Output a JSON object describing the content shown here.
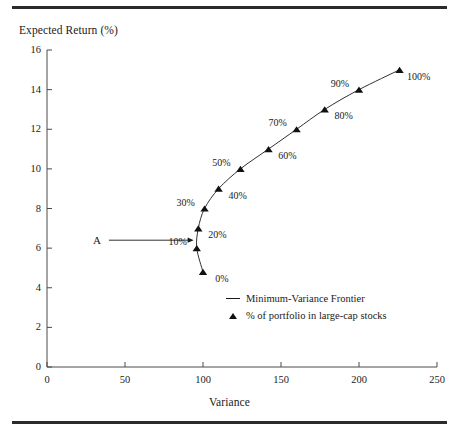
{
  "figure": {
    "top_rule": "horizontal-rule",
    "bottom_rule": "horizontal-rule"
  },
  "chart_data": {
    "type": "scatter",
    "title": "",
    "xlabel": "Variance",
    "ylabel": "Expected Return (%)",
    "xlim": [
      0,
      250
    ],
    "ylim": [
      0,
      16
    ],
    "xticks": [
      0,
      50,
      100,
      150,
      200,
      250
    ],
    "yticks": [
      0,
      2,
      4,
      6,
      8,
      10,
      12,
      14,
      16
    ],
    "grid": false,
    "legend_position": "inside-lower-right",
    "series": [
      {
        "name": "Minimum-Variance Frontier",
        "marker": "triangle",
        "x": [
          100,
          96,
          97,
          101,
          110,
          124,
          142,
          160,
          178,
          200,
          226
        ],
        "y": [
          4.8,
          6.0,
          7.0,
          8.0,
          9.0,
          10.0,
          11.0,
          12.0,
          13.0,
          14.0,
          15.0
        ],
        "point_labels": [
          "0%",
          "10%",
          "20%",
          "30%",
          "40%",
          "50%",
          "60%",
          "70%",
          "80%",
          "90%",
          "100%"
        ],
        "label_placement": [
          "right",
          "left",
          "right",
          "left",
          "right",
          "left",
          "right",
          "left",
          "right",
          "left",
          "right"
        ]
      }
    ],
    "annotations": [
      {
        "text": "A",
        "x": 32,
        "y": 6.4,
        "arrow_to_x": 94,
        "arrow_to_y": 6.4
      }
    ],
    "legend": [
      {
        "key": "line",
        "label": "Minimum-Variance Frontier"
      },
      {
        "key": "triangle",
        "label": "% of portfolio in large-cap stocks"
      }
    ]
  },
  "colors": {
    "ink": "#1a1a1a",
    "marker": "#111111",
    "rule": "#2b2b2b",
    "axis": "#4a4a4a"
  }
}
